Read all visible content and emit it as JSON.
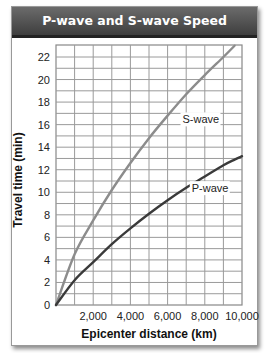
{
  "title": "P-wave and S-wave Speed",
  "chart_data": {
    "type": "line",
    "title": "P-wave and S-wave Speed",
    "xlabel": "Epicenter distance (km)",
    "ylabel": "Travel time (min)",
    "xlim": [
      0,
      10000
    ],
    "ylim": [
      0,
      23
    ],
    "grid": true,
    "x_ticks": [
      "2,000",
      "4,000",
      "6,000",
      "8,000",
      "10,000"
    ],
    "y_ticks": [
      "0",
      "2",
      "4",
      "6",
      "8",
      "10",
      "12",
      "14",
      "16",
      "18",
      "20",
      "22"
    ],
    "x": [
      0,
      1000,
      2000,
      3000,
      4000,
      5000,
      6000,
      7000,
      8000,
      9000,
      9600,
      10000
    ],
    "series": [
      {
        "name": "S-wave",
        "color": "#8c8c8c",
        "values": [
          0,
          4.5,
          7.5,
          10.2,
          12.6,
          14.8,
          16.8,
          18.7,
          20.4,
          22.0,
          23.0,
          null
        ]
      },
      {
        "name": "P-wave",
        "color": "#3a3a3a",
        "values": [
          0,
          2.2,
          3.8,
          5.4,
          6.8,
          8.1,
          9.3,
          10.4,
          11.4,
          12.4,
          12.9,
          13.2
        ]
      }
    ],
    "annotations": [
      {
        "text": "S-wave",
        "x": 6800,
        "y": 16.2
      },
      {
        "text": "P-wave",
        "x": 7300,
        "y": 10.1
      }
    ]
  }
}
